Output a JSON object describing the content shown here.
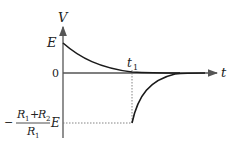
{
  "diagram": {
    "type": "voltage-time graph",
    "axes": {
      "y_label": "V",
      "x_label": "t"
    },
    "labels": {
      "E": "E",
      "zero": "0",
      "t1": "t",
      "t1_sub": "1",
      "neg_minus": "−",
      "neg_num_R1": "R",
      "neg_num_R1_sub": "1",
      "neg_plus": "+",
      "neg_num_R2": "R",
      "neg_num_R2_sub": "2",
      "neg_den_R1": "R",
      "neg_den_R1_sub": "1",
      "neg_E": "E"
    },
    "curves": [
      {
        "name": "decay from E to 0",
        "from_t": 0,
        "to_t": "t1",
        "start_value": "E",
        "end_value": 0
      },
      {
        "name": "recovery from -(R1+R2)/R1 E to 0",
        "from_t": "t1",
        "start_value": "-(R1+R2)/R1 E",
        "end_value": 0
      }
    ],
    "colors": {
      "axis": "#555555",
      "curve": "#1a1a1a",
      "dashed": "#777777"
    }
  }
}
